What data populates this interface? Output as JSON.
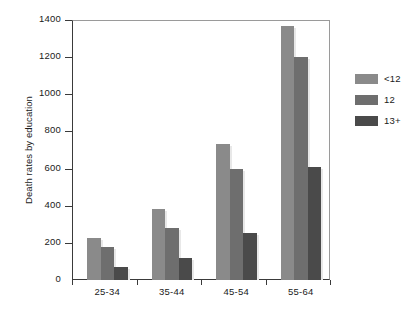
{
  "chart_data": {
    "type": "bar",
    "title": "",
    "subtitle": "",
    "xlabel": "",
    "ylabel": "Death rates by education",
    "categories": [
      "25-34",
      "35-44",
      "45-54",
      "55-64"
    ],
    "series": [
      {
        "name": "<12",
        "color": "#8a8a8a",
        "values": [
          225,
          385,
          735,
          1370
        ]
      },
      {
        "name": "12",
        "color": "#6e6e6e",
        "values": [
          180,
          280,
          600,
          1200
        ]
      },
      {
        "name": "13+",
        "color": "#4a4a4a",
        "values": [
          70,
          120,
          255,
          610
        ]
      }
    ],
    "ylim": [
      0,
      1400
    ],
    "ytick_labels": [
      "0",
      "200",
      "400",
      "600",
      "800",
      "1000",
      "1200",
      "1400"
    ],
    "ytick_values": [
      0,
      200,
      400,
      600,
      800,
      1000,
      1200,
      1400
    ],
    "grid": false,
    "legend_position": "right"
  },
  "legend": {
    "entries": [
      {
        "label": "<12",
        "color": "#8a8a8a"
      },
      {
        "label": "12",
        "color": "#6e6e6e"
      },
      {
        "label": "13+",
        "color": "#4a4a4a"
      }
    ]
  }
}
